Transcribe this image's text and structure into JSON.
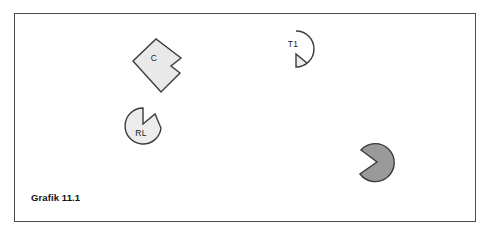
{
  "figure": {
    "caption": "Grafik 11.1",
    "background_color": "#ffffff",
    "frame_color": "#4a4a4f",
    "shapes": [
      {
        "id": "shape-c",
        "label": "C",
        "kind": "notched-rotated-square",
        "fill": "#e9e9e9",
        "stroke": "#3c3c3c",
        "center": [
          146,
          41
        ],
        "size": 38
      },
      {
        "id": "shape-t1",
        "label": "T1",
        "kind": "notched-circle",
        "fill": "#ececec",
        "stroke": "#3c3c3c",
        "center": [
          281,
          35
        ],
        "radius": 18,
        "notch_direction": "bottom-right"
      },
      {
        "id": "shape-rl",
        "label": "RL",
        "kind": "notched-circle",
        "fill": "#ececec",
        "stroke": "#3c3c3c",
        "center": [
          128,
          112
        ],
        "radius": 18,
        "notch_direction": "top-right"
      },
      {
        "id": "shape-dark",
        "label": "",
        "kind": "notched-circle",
        "fill": "#9a9a9a",
        "stroke": "#3c3c3c",
        "center": [
          363,
          149
        ],
        "radius": 19,
        "notch_direction": "left"
      }
    ]
  }
}
